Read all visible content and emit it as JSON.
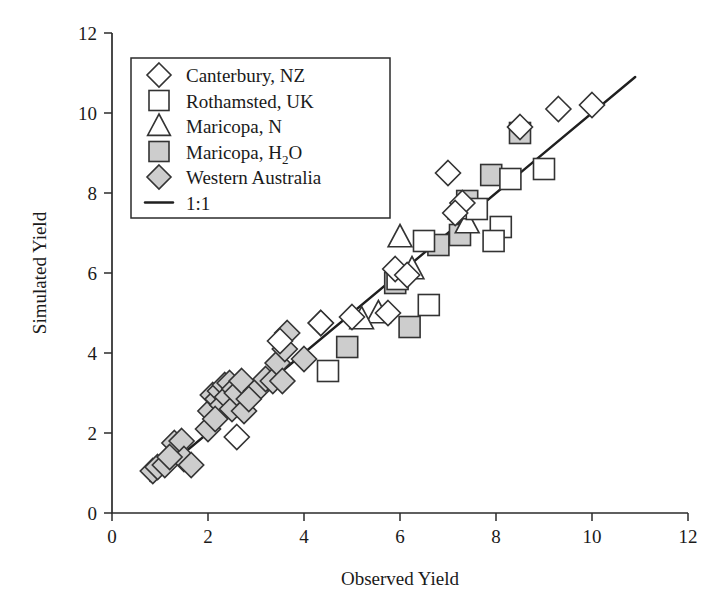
{
  "chart_data": {
    "type": "scatter",
    "title": "",
    "xlabel": "Observed Yield",
    "ylabel": "Simulated Yield",
    "xlim": [
      0,
      12
    ],
    "ylim": [
      0,
      12
    ],
    "xticks": [
      0,
      2,
      4,
      6,
      8,
      10,
      12
    ],
    "yticks": [
      0,
      2,
      4,
      6,
      8,
      10,
      12
    ],
    "xticklabels": [
      "0",
      "2",
      "4",
      "6",
      "8",
      "10",
      "12"
    ],
    "yticklabels": [
      "0",
      "2",
      "4",
      "6",
      "8",
      "10",
      "12"
    ],
    "grid": false,
    "legend_position": "top-left",
    "reference_line": {
      "label": "1:1",
      "slope": 1,
      "intercept": 0,
      "x_from": 0.8,
      "x_to": 10.9
    },
    "series": [
      {
        "name": "Canterbury, NZ",
        "marker": "diamond",
        "fill": "none",
        "points": [
          [
            5.9,
            6.1
          ],
          [
            7.3,
            7.75
          ],
          [
            8.5,
            9.65
          ],
          [
            9.3,
            10.1
          ],
          [
            10.0,
            10.2
          ],
          [
            7.0,
            8.5
          ],
          [
            5.0,
            4.9
          ],
          [
            4.35,
            4.75
          ],
          [
            3.5,
            4.3
          ],
          [
            5.75,
            5.0
          ],
          [
            6.15,
            5.95
          ],
          [
            2.6,
            1.9
          ],
          [
            7.15,
            7.5
          ]
        ]
      },
      {
        "name": "Rothamsted, UK",
        "marker": "square",
        "fill": "none",
        "points": [
          [
            5.95,
            5.85
          ],
          [
            6.5,
            6.8
          ],
          [
            6.6,
            5.2
          ],
          [
            7.6,
            7.6
          ],
          [
            8.3,
            8.35
          ],
          [
            9.0,
            8.6
          ],
          [
            8.1,
            7.15
          ],
          [
            7.95,
            6.8
          ],
          [
            4.5,
            3.55
          ]
        ]
      },
      {
        "name": "Maricopa, N",
        "marker": "triangle",
        "fill": "none",
        "points": [
          [
            6.0,
            6.9
          ],
          [
            6.25,
            6.1
          ],
          [
            5.55,
            5.0
          ],
          [
            5.2,
            4.85
          ],
          [
            7.4,
            7.25
          ],
          [
            7.25,
            7.6
          ]
        ]
      },
      {
        "name": "Maricopa, H2O",
        "marker": "square",
        "fill": "gray",
        "points": [
          [
            4.9,
            4.15
          ],
          [
            5.9,
            5.75
          ],
          [
            6.2,
            4.65
          ],
          [
            6.8,
            6.7
          ],
          [
            7.4,
            7.8
          ],
          [
            7.9,
            8.45
          ],
          [
            8.5,
            9.5
          ],
          [
            7.25,
            6.95
          ]
        ]
      },
      {
        "name": "Western Australia",
        "marker": "diamond",
        "fill": "gray",
        "points": [
          [
            0.85,
            1.05
          ],
          [
            0.95,
            1.15
          ],
          [
            1.1,
            1.2
          ],
          [
            1.3,
            1.75
          ],
          [
            1.45,
            1.8
          ],
          [
            1.5,
            1.35
          ],
          [
            1.65,
            1.2
          ],
          [
            2.0,
            2.1
          ],
          [
            2.05,
            2.55
          ],
          [
            2.1,
            2.95
          ],
          [
            2.2,
            2.85
          ],
          [
            2.25,
            3.05
          ],
          [
            2.3,
            2.7
          ],
          [
            2.35,
            3.2
          ],
          [
            2.4,
            2.9
          ],
          [
            2.45,
            3.25
          ],
          [
            2.5,
            2.6
          ],
          [
            2.55,
            3.1
          ],
          [
            2.6,
            3.0
          ],
          [
            2.7,
            3.3
          ],
          [
            2.75,
            2.55
          ],
          [
            3.0,
            3.05
          ],
          [
            3.2,
            3.35
          ],
          [
            3.35,
            3.3
          ],
          [
            3.45,
            3.75
          ],
          [
            3.55,
            3.3
          ],
          [
            3.6,
            4.1
          ],
          [
            3.65,
            4.5
          ],
          [
            4.0,
            3.85
          ],
          [
            4.35,
            4.75
          ],
          [
            1.2,
            1.4
          ],
          [
            2.15,
            2.35
          ],
          [
            2.85,
            2.85
          ]
        ]
      }
    ]
  },
  "legend": {
    "items": [
      {
        "label": "Canterbury, NZ",
        "marker": "diamond-open"
      },
      {
        "label": "Rothamsted, UK",
        "marker": "square-open"
      },
      {
        "label": "Maricopa, N",
        "marker": "triangle-open"
      },
      {
        "label": "Maricopa, H",
        "sub": "2",
        "label_tail": "O",
        "marker": "square-gray"
      },
      {
        "label": "Western Australia",
        "marker": "diamond-gray"
      },
      {
        "label": "1:1",
        "marker": "line"
      }
    ]
  },
  "colors": {
    "marker_fill_gray": "#cdcdcd",
    "marker_stroke": "#333333",
    "axis": "#2b2b2b",
    "line": "#1f1f1f",
    "text": "#1a1a1a",
    "background": "#ffffff"
  }
}
